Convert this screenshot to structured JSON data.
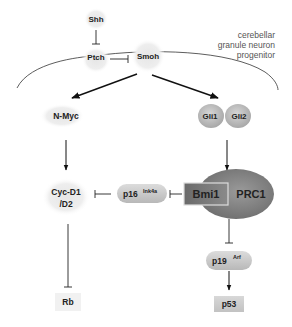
{
  "diagram": {
    "cell_label": [
      "cerebellar",
      "granule neuron",
      "progenitor"
    ],
    "nodes": {
      "shh": "Shh",
      "ptch": "Ptch",
      "smoh": "Smoh",
      "nmyc": "N-Myc",
      "gli1": "Gli1",
      "gli2": "Gli2",
      "cyc_line1": "Cyc-D1",
      "cyc_line2": "/D2",
      "p16": "p16",
      "p16_sup": "Ink4a",
      "bmi1": "Bmi1",
      "prc1": "PRC1",
      "p19": "p19",
      "p19_sup": "Arf",
      "p53": "p53",
      "rb": "Rb"
    },
    "edges": [
      {
        "from": "Shh",
        "to": "Ptch",
        "type": "inhibit"
      },
      {
        "from": "Ptch",
        "to": "Smoh",
        "type": "inhibit"
      },
      {
        "from": "Smoh",
        "to": "N-Myc",
        "type": "activate"
      },
      {
        "from": "Smoh",
        "to": "Gli1/Gli2",
        "type": "activate"
      },
      {
        "from": "N-Myc",
        "to": "Cyc-D1/D2",
        "type": "activate"
      },
      {
        "from": "Gli1/Gli2",
        "to": "Bmi1",
        "type": "activate"
      },
      {
        "from": "p16Ink4a",
        "to": "Cyc-D1/D2",
        "type": "inhibit"
      },
      {
        "from": "Bmi1",
        "to": "p16Ink4a",
        "type": "inhibit"
      },
      {
        "from": "Bmi1",
        "to": "p19Arf",
        "type": "inhibit"
      },
      {
        "from": "p19Arf",
        "to": "p53",
        "type": "activate"
      },
      {
        "from": "Cyc-D1/D2",
        "to": "Rb",
        "type": "inhibit"
      }
    ]
  }
}
